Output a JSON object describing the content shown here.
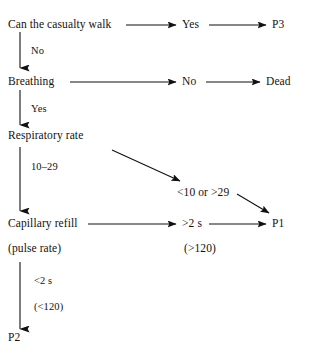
{
  "diagram": {
    "background_color": "#ffffff",
    "line_color": "#111111",
    "text_color": "#121212",
    "nodes": {
      "walk": "Can the casualty walk",
      "yes_walk": "Yes",
      "p3": "P3",
      "breathing": "Breathing",
      "no_breathing": "No",
      "dead": "Dead",
      "respiratory_rate": "Respiratory rate",
      "rate_out_of_range": "<10 or >29",
      "capillary_refill": "Capillary refill",
      "refill_gt2s": ">2 s",
      "p1": "P1",
      "pulse_rate": "(pulse rate)",
      "pulse_gt120": "(>120)",
      "p2": "P2"
    },
    "edge_labels": {
      "no": "No",
      "yes": "Yes",
      "rate_10_29": "10–29",
      "refill_lt2s": "<2 s",
      "pulse_lt120": "(<120)"
    }
  }
}
